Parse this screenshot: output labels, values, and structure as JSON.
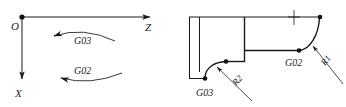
{
  "figure": {
    "background_color": "#ffffff",
    "line_color": "#1a1a1a",
    "width": 346,
    "height": 107
  },
  "left_panel": {
    "name": "coordinate-system-panel",
    "origin_label": "O",
    "z_axis_label": "Z",
    "x_axis_label": "X",
    "arc_ccw_label": "G03",
    "arc_cw_label": "G02",
    "origin": {
      "x": 22,
      "y": 17
    },
    "z_axis_end": {
      "x": 155,
      "y": 17
    },
    "x_axis_end": {
      "x": 22,
      "y": 84
    }
  },
  "right_panel": {
    "name": "workpiece-profile-panel",
    "arc_ccw_label": "G03",
    "arc_cw_label": "G02",
    "radius_label_1": "R1",
    "radius_label_2": "R2",
    "profile_top_y": 17,
    "profile_step_y": 50,
    "profile_bottom_y": 79
  },
  "labels": {
    "origin": "O",
    "z": "Z",
    "x": "X",
    "g02": "G02",
    "g03": "G03",
    "r1": "R1",
    "r2": "R2"
  }
}
